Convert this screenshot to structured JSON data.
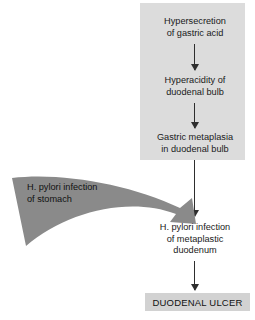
{
  "diagram": {
    "type": "flowchart",
    "colors": {
      "panel_background": "#dcdcdc",
      "outcome_box_background": "#d2d2d2",
      "curved_arrow_fill": "#8a8a8a",
      "arrow_stroke": "#2e2e2e",
      "text": "#1a1a1a",
      "page_background": "#ffffff"
    },
    "nodes": {
      "hypersecretion": {
        "lines": [
          "Hypersecretion",
          "of gastric acid"
        ],
        "line1": "Hypersecretion",
        "line2": "of gastric acid"
      },
      "hyperacidity": {
        "lines": [
          "Hyperacidity of",
          "duodenal bulb"
        ],
        "line1": "Hyperacidity of",
        "line2": "duodenal bulb"
      },
      "metaplasia": {
        "lines": [
          "Gastric metaplasia",
          "in duodenal bulb"
        ],
        "line1": "Gastric metaplasia",
        "line2": "in duodenal bulb"
      },
      "hp_stomach": {
        "lines": [
          "H. pylori infection",
          "of stomach"
        ],
        "line1": "H. pylori infection",
        "line2": "of stomach"
      },
      "hp_duodenum": {
        "lines": [
          "H. pylori infection",
          "of metaplastic",
          "duodenum"
        ],
        "line1": "H. pylori infection",
        "line2": "of metaplastic",
        "line3": "duodenum"
      },
      "outcome": {
        "label": "DUODENAL ULCER"
      }
    },
    "edges": [
      {
        "from": "hypersecretion",
        "to": "hyperacidity",
        "style": "straight-down-arrow"
      },
      {
        "from": "hyperacidity",
        "to": "metaplasia",
        "style": "straight-down-arrow"
      },
      {
        "from": "metaplasia",
        "to": "hp_duodenum",
        "style": "straight-down-arrow"
      },
      {
        "from": "hp_stomach",
        "to": "hp_duodenum",
        "style": "curved-sweeping-arrow"
      },
      {
        "from": "hp_duodenum",
        "to": "outcome",
        "style": "straight-down-arrow"
      }
    ]
  }
}
